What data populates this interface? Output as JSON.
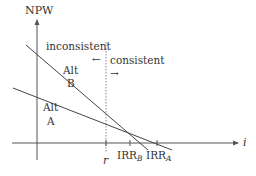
{
  "diagram": {
    "axes": {
      "y_label": "NPW",
      "x_label": "i"
    },
    "lines": [
      {
        "name": "Alt B",
        "label_line1": "Alt",
        "label_line2": "B"
      },
      {
        "name": "Alt A",
        "label_line1": "Alt",
        "label_line2": "A"
      }
    ],
    "marker": {
      "label": "r",
      "left_region": "inconsistent",
      "left_arrow": "←",
      "right_region": "consistent",
      "right_arrow": "→"
    },
    "intercepts": [
      {
        "main": "IRR",
        "sub": "B"
      },
      {
        "main": "IRR",
        "sub": "A"
      }
    ],
    "colors": {
      "line": "#444444",
      "axis": "#555555",
      "text": "#333333"
    }
  }
}
